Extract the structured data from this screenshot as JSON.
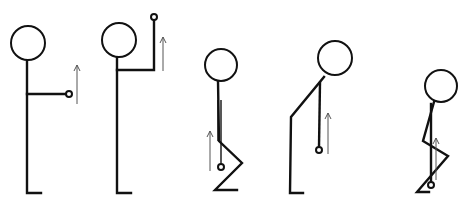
{
  "diagram": {
    "title": "",
    "colors": {
      "line": "#111111",
      "arrow": "#555555",
      "background": "#ffffff"
    },
    "figures": [
      {
        "id": "figure-1-arm-forward",
        "head": {
          "cx": 28,
          "cy": 43,
          "r": 17
        },
        "body": [
          [
            27,
            60
          ],
          [
            27,
            193
          ],
          [
            41,
            193
          ]
        ],
        "arm": [
          [
            27,
            94
          ],
          [
            66,
            94
          ]
        ],
        "arm_double": null,
        "hand": {
          "cx": 69,
          "cy": 94,
          "r": 3
        },
        "arrow": {
          "x": 77,
          "y1": 104,
          "y2": 65
        }
      },
      {
        "id": "figure-2-arm-raised",
        "head": {
          "cx": 119,
          "cy": 40,
          "r": 17
        },
        "body": [
          [
            117,
            57
          ],
          [
            117,
            193
          ],
          [
            131,
            193
          ]
        ],
        "arm": [
          [
            117,
            70
          ],
          [
            154,
            70
          ],
          [
            154,
            20
          ]
        ],
        "arm_double": null,
        "hand": {
          "cx": 154,
          "cy": 17,
          "r": 3
        },
        "arrow": {
          "x": 163,
          "y1": 71,
          "y2": 37
        }
      },
      {
        "id": "figure-3-squat-upright",
        "head": {
          "cx": 221,
          "cy": 65,
          "r": 16
        },
        "body": [
          [
            218,
            81
          ],
          [
            219,
            141
          ],
          [
            242,
            163
          ],
          [
            215,
            190
          ],
          [
            237,
            190
          ]
        ],
        "arm": [
          [
            221,
            100
          ],
          [
            221,
            164
          ]
        ],
        "arm_double": [
          [
            218,
            100
          ],
          [
            221,
            100
          ]
        ],
        "hand": {
          "cx": 221,
          "cy": 167,
          "r": 3
        },
        "arrow": {
          "x": 210,
          "y1": 171,
          "y2": 131
        }
      },
      {
        "id": "figure-4-bent-over",
        "head": {
          "cx": 335,
          "cy": 58,
          "r": 17
        },
        "body": [
          [
            324,
            77
          ],
          [
            291,
            117
          ],
          [
            290,
            193
          ],
          [
            303,
            193
          ]
        ],
        "arm": [
          [
            320,
            83
          ],
          [
            319,
            147
          ]
        ],
        "arm_double": null,
        "hand": {
          "cx": 319,
          "cy": 150,
          "r": 3
        },
        "arrow": {
          "x": 328,
          "y1": 154,
          "y2": 113
        }
      },
      {
        "id": "figure-5-deep-squat",
        "head": {
          "cx": 441,
          "cy": 86,
          "r": 16
        },
        "body": [
          [
            434,
            102
          ],
          [
            423,
            141
          ],
          [
            448,
            156
          ],
          [
            417,
            192
          ],
          [
            429,
            192
          ]
        ],
        "arm": [
          [
            431,
            104
          ],
          [
            431,
            182
          ]
        ],
        "arm_double": null,
        "hand": {
          "cx": 431,
          "cy": 185,
          "r": 3
        },
        "arrow": {
          "x": 436,
          "y1": 180,
          "y2": 138
        }
      }
    ]
  }
}
